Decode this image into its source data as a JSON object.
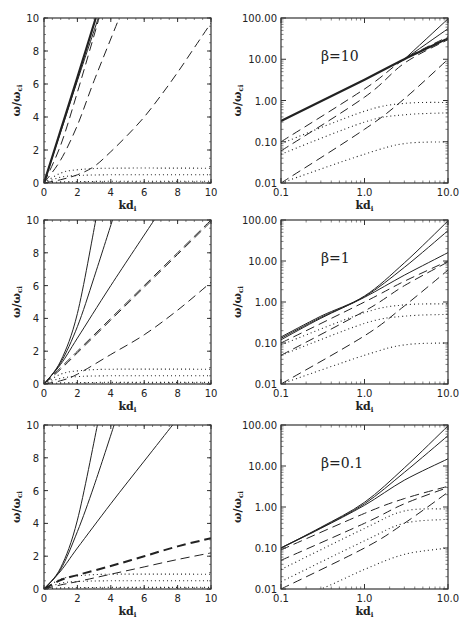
{
  "figure": {
    "xlabel": "kd",
    "xlabel_sub": "i",
    "ylabel": "ω/ω",
    "ylabel_sub": "ci"
  },
  "chart_data": [
    {
      "id": "linear-beta10",
      "type": "line",
      "row": 0,
      "col": 0,
      "scale": "linear",
      "title": "",
      "xlabel": "kd_i",
      "ylabel": "ω/ω_ci",
      "xlim": [
        0,
        10
      ],
      "ylim": [
        0,
        10
      ],
      "xticks": [
        "0",
        "2",
        "4",
        "6",
        "8",
        "10"
      ],
      "yticks": [
        "0",
        "2",
        "4",
        "6",
        "8",
        "10"
      ],
      "series": [
        {
          "name": "solid-1",
          "style": "solid",
          "width": 2.2,
          "x": [
            0,
            1,
            2,
            3.1
          ],
          "y": [
            0,
            3.2,
            6.4,
            10
          ]
        },
        {
          "name": "solid-2",
          "style": "solid",
          "width": 1,
          "x": [
            0,
            1,
            2,
            3.25
          ],
          "y": [
            0,
            3.1,
            6.2,
            10
          ]
        },
        {
          "name": "dash-1",
          "style": "dash",
          "x": [
            0,
            1,
            2,
            3.3
          ],
          "y": [
            0,
            2.3,
            5.5,
            10
          ]
        },
        {
          "name": "dash-2",
          "style": "dash",
          "x": [
            0,
            1,
            2,
            3,
            4.5
          ],
          "y": [
            0,
            1.4,
            3.5,
            6.2,
            10
          ]
        },
        {
          "name": "dash-3",
          "style": "dash",
          "x": [
            0,
            1,
            2,
            3,
            4,
            5,
            6,
            7,
            8,
            9,
            10
          ],
          "y": [
            0,
            0.2,
            0.5,
            1.0,
            1.9,
            2.9,
            4.0,
            5.3,
            6.7,
            8.2,
            9.7
          ]
        },
        {
          "name": "dot-1",
          "style": "dot",
          "x": [
            0,
            1,
            2,
            4,
            10
          ],
          "y": [
            0,
            0.6,
            0.8,
            0.9,
            0.9
          ]
        },
        {
          "name": "dot-2",
          "style": "dot",
          "x": [
            0,
            1,
            2,
            4,
            10
          ],
          "y": [
            0,
            0.35,
            0.45,
            0.5,
            0.5
          ]
        },
        {
          "name": "dot-3",
          "style": "dot",
          "x": [
            0,
            1,
            2,
            4,
            10
          ],
          "y": [
            0,
            0.06,
            0.08,
            0.1,
            0.1
          ]
        }
      ]
    },
    {
      "id": "log-beta10",
      "type": "line",
      "row": 0,
      "col": 1,
      "scale": "log",
      "title": "β=10",
      "xlabel": "kd_i",
      "ylabel": "ω/ω_ci",
      "xlim": [
        0.1,
        10.0
      ],
      "ylim": [
        0.01,
        100.0
      ],
      "xticks": [
        "0.1",
        "1.0",
        "10.0"
      ],
      "yticks": [
        "0.01",
        "0.10",
        "1.00",
        "10.00",
        "100.00"
      ],
      "series": [
        {
          "name": "solid-thick",
          "style": "solid",
          "width": 2.2,
          "x": [
            0.1,
            1,
            3,
            10
          ],
          "y": [
            0.32,
            3.2,
            10,
            32
          ]
        },
        {
          "name": "solid-2",
          "style": "solid",
          "width": 1,
          "x": [
            3,
            10
          ],
          "y": [
            10,
            95
          ]
        },
        {
          "name": "solid-3",
          "style": "solid",
          "width": 1,
          "x": [
            3,
            10
          ],
          "y": [
            10,
            55
          ]
        },
        {
          "name": "dash-1",
          "style": "dash",
          "x": [
            0.1,
            1,
            3,
            10
          ],
          "y": [
            0.1,
            1.9,
            10,
            35
          ]
        },
        {
          "name": "dash-2",
          "style": "dash",
          "x": [
            0.1,
            1,
            3,
            10
          ],
          "y": [
            0.06,
            1.2,
            8,
            30
          ]
        },
        {
          "name": "dash-3",
          "style": "dash",
          "x": [
            0.1,
            1,
            3,
            10
          ],
          "y": [
            0.01,
            0.2,
            1.1,
            10
          ]
        },
        {
          "name": "dot-1",
          "style": "dot",
          "x": [
            0.1,
            1,
            3,
            10
          ],
          "y": [
            0.09,
            0.55,
            0.85,
            0.9
          ]
        },
        {
          "name": "dot-2",
          "style": "dot",
          "x": [
            0.1,
            1,
            3,
            10
          ],
          "y": [
            0.05,
            0.3,
            0.45,
            0.5
          ]
        },
        {
          "name": "dot-3",
          "style": "dot",
          "x": [
            0.1,
            1,
            3,
            10
          ],
          "y": [
            0.01,
            0.05,
            0.09,
            0.1
          ]
        }
      ]
    },
    {
      "id": "linear-beta1",
      "type": "line",
      "row": 1,
      "col": 0,
      "scale": "linear",
      "title": "",
      "xlabel": "kd_i",
      "ylabel": "ω/ω_ci",
      "xlim": [
        0,
        10
      ],
      "ylim": [
        0,
        10
      ],
      "xticks": [
        "0",
        "2",
        "4",
        "6",
        "8",
        "10"
      ],
      "yticks": [
        "0",
        "2",
        "4",
        "6",
        "8",
        "10"
      ],
      "series": [
        {
          "name": "solid-1",
          "style": "solid",
          "width": 1,
          "x": [
            0,
            1,
            2,
            3.1
          ],
          "y": [
            0,
            1.4,
            4.3,
            10
          ]
        },
        {
          "name": "solid-2",
          "style": "solid",
          "width": 1,
          "x": [
            0,
            1,
            2,
            3,
            4.1
          ],
          "y": [
            0,
            1.3,
            3.5,
            6.5,
            10
          ]
        },
        {
          "name": "solid-3",
          "style": "solid",
          "width": 1,
          "x": [
            0,
            1,
            2,
            4,
            6.6
          ],
          "y": [
            0,
            1.2,
            2.8,
            6,
            10
          ]
        },
        {
          "name": "dash-1",
          "style": "dash",
          "x": [
            0,
            1,
            2,
            4,
            6,
            8,
            10
          ],
          "y": [
            0,
            1.0,
            2.0,
            4.0,
            6.0,
            8.0,
            10
          ]
        },
        {
          "name": "dash-2",
          "style": "dash",
          "x": [
            0,
            1,
            2,
            4,
            6,
            8,
            10
          ],
          "y": [
            0,
            0.9,
            1.9,
            3.9,
            5.9,
            7.9,
            9.9
          ]
        },
        {
          "name": "dash-3",
          "style": "dash",
          "x": [
            0,
            1,
            2,
            4,
            6,
            8,
            10
          ],
          "y": [
            0,
            0.2,
            0.6,
            1.8,
            3.0,
            4.5,
            6.2
          ]
        },
        {
          "name": "dot-1",
          "style": "dot",
          "x": [
            0,
            1,
            2,
            4,
            10
          ],
          "y": [
            0,
            0.6,
            0.8,
            0.9,
            0.9
          ]
        },
        {
          "name": "dot-2",
          "style": "dot",
          "x": [
            0,
            1,
            2,
            4,
            10
          ],
          "y": [
            0,
            0.35,
            0.45,
            0.5,
            0.5
          ]
        },
        {
          "name": "dot-3",
          "style": "dot",
          "x": [
            0,
            1,
            2,
            4,
            10
          ],
          "y": [
            0,
            0.06,
            0.08,
            0.1,
            0.1
          ]
        }
      ]
    },
    {
      "id": "log-beta1",
      "type": "line",
      "row": 1,
      "col": 1,
      "scale": "log",
      "title": "β=1",
      "xlabel": "kd_i",
      "ylabel": "ω/ω_ci",
      "xlim": [
        0.1,
        10.0
      ],
      "ylim": [
        0.01,
        100.0
      ],
      "xticks": [
        "0.1",
        "1.0",
        "10.0"
      ],
      "yticks": [
        "0.01",
        "0.10",
        "1.00",
        "10.00",
        "100.00"
      ],
      "series": [
        {
          "name": "solid-1",
          "style": "solid",
          "width": 1,
          "x": [
            0.1,
            0.3,
            1,
            3,
            10
          ],
          "y": [
            0.14,
            0.45,
            1.4,
            9,
            95
          ]
        },
        {
          "name": "solid-2",
          "style": "solid",
          "width": 1,
          "x": [
            0.1,
            0.3,
            1,
            3,
            10
          ],
          "y": [
            0.13,
            0.42,
            1.35,
            7,
            55
          ]
        },
        {
          "name": "solid-3",
          "style": "solid",
          "width": 1,
          "x": [
            0.1,
            0.3,
            1,
            3,
            10
          ],
          "y": [
            0.12,
            0.4,
            1.3,
            4.5,
            16
          ]
        },
        {
          "name": "dash-1",
          "style": "dash",
          "x": [
            0.1,
            1,
            3,
            10
          ],
          "y": [
            0.1,
            1.0,
            3.2,
            10
          ]
        },
        {
          "name": "dash-2",
          "style": "dash",
          "x": [
            0.1,
            1,
            3,
            10
          ],
          "y": [
            0.05,
            0.6,
            2.5,
            9.5
          ]
        },
        {
          "name": "dash-3",
          "style": "dash",
          "x": [
            0.1,
            1,
            3,
            10
          ],
          "y": [
            0.01,
            0.15,
            0.8,
            6
          ]
        },
        {
          "name": "dot-1",
          "style": "dot",
          "x": [
            0.1,
            1,
            3,
            10
          ],
          "y": [
            0.09,
            0.55,
            0.85,
            0.9
          ]
        },
        {
          "name": "dot-2",
          "style": "dot",
          "x": [
            0.1,
            1,
            3,
            10
          ],
          "y": [
            0.05,
            0.3,
            0.45,
            0.5
          ]
        },
        {
          "name": "dot-3",
          "style": "dot",
          "x": [
            0.1,
            1,
            3,
            10
          ],
          "y": [
            0.01,
            0.05,
            0.09,
            0.1
          ]
        }
      ]
    },
    {
      "id": "linear-beta0.1",
      "type": "line",
      "row": 2,
      "col": 0,
      "scale": "linear",
      "title": "",
      "xlabel": "kd_i",
      "ylabel": "ω/ω_ci",
      "xlim": [
        0,
        10
      ],
      "ylim": [
        0,
        10
      ],
      "xticks": [
        "0",
        "2",
        "4",
        "6",
        "8",
        "10"
      ],
      "yticks": [
        "0",
        "2",
        "4",
        "6",
        "8",
        "10"
      ],
      "series": [
        {
          "name": "solid-1",
          "style": "solid",
          "width": 1,
          "x": [
            0,
            1,
            2,
            3.2
          ],
          "y": [
            0,
            1.3,
            4.2,
            10
          ]
        },
        {
          "name": "solid-2",
          "style": "solid",
          "width": 1,
          "x": [
            0,
            1,
            2,
            3,
            4.2
          ],
          "y": [
            0,
            1.2,
            3.5,
            6.3,
            10
          ]
        },
        {
          "name": "solid-3",
          "style": "solid",
          "width": 1,
          "x": [
            0,
            1,
            2,
            4,
            6,
            7.7
          ],
          "y": [
            0,
            1.1,
            2.5,
            5.2,
            7.8,
            10
          ]
        },
        {
          "name": "dash-thick",
          "style": "dash",
          "width": 2,
          "x": [
            0,
            1,
            2,
            4,
            6,
            8,
            10
          ],
          "y": [
            0,
            0.55,
            0.85,
            1.4,
            2.0,
            2.6,
            3.1
          ]
        },
        {
          "name": "dash-2",
          "style": "dash",
          "x": [
            0,
            1,
            2,
            4,
            6,
            8,
            10
          ],
          "y": [
            0,
            0.25,
            0.45,
            0.9,
            1.35,
            1.8,
            2.2
          ]
        },
        {
          "name": "dot-1",
          "style": "dot",
          "x": [
            0,
            1,
            2,
            4,
            10
          ],
          "y": [
            0,
            0.6,
            0.8,
            0.9,
            0.9
          ]
        },
        {
          "name": "dot-2",
          "style": "dot",
          "x": [
            0,
            1,
            2,
            4,
            10
          ],
          "y": [
            0,
            0.35,
            0.45,
            0.5,
            0.5
          ]
        },
        {
          "name": "dot-3",
          "style": "dot",
          "x": [
            0,
            1,
            2,
            4,
            10
          ],
          "y": [
            0,
            0.06,
            0.08,
            0.1,
            0.1
          ]
        }
      ]
    },
    {
      "id": "log-beta0.1",
      "type": "line",
      "row": 2,
      "col": 1,
      "scale": "log",
      "title": "β=0.1",
      "xlabel": "kd_i",
      "ylabel": "ω/ω_ci",
      "xlim": [
        0.1,
        10.0
      ],
      "ylim": [
        0.01,
        100.0
      ],
      "xticks": [
        "0.1",
        "1.0",
        "10.0"
      ],
      "yticks": [
        "0.01",
        "0.10",
        "1.00",
        "10.00",
        "100.00"
      ],
      "series": [
        {
          "name": "solid-1",
          "style": "solid",
          "width": 1,
          "x": [
            0.1,
            0.3,
            1,
            3,
            10
          ],
          "y": [
            0.1,
            0.32,
            1.3,
            9,
            95
          ]
        },
        {
          "name": "solid-2",
          "style": "solid",
          "width": 1,
          "x": [
            0.1,
            0.3,
            1,
            3,
            10
          ],
          "y": [
            0.1,
            0.31,
            1.2,
            7,
            55
          ]
        },
        {
          "name": "solid-3",
          "style": "solid",
          "width": 1,
          "x": [
            0.1,
            0.3,
            1,
            3,
            10
          ],
          "y": [
            0.1,
            0.3,
            1.1,
            4.5,
            15
          ]
        },
        {
          "name": "dash-1",
          "style": "dash",
          "x": [
            0.1,
            1,
            3,
            10
          ],
          "y": [
            0.09,
            0.7,
            1.6,
            3.2
          ]
        },
        {
          "name": "dash-2",
          "style": "dash",
          "x": [
            0.1,
            1,
            3,
            10
          ],
          "y": [
            0.05,
            0.4,
            1.2,
            3.0
          ]
        },
        {
          "name": "dash-3",
          "style": "dash",
          "x": [
            0.1,
            1,
            3,
            10
          ],
          "y": [
            0.01,
            0.1,
            0.4,
            2.3
          ]
        },
        {
          "name": "dot-1",
          "style": "dot",
          "x": [
            0.1,
            1,
            3,
            10
          ],
          "y": [
            0.03,
            0.3,
            0.8,
            0.9
          ]
        },
        {
          "name": "dot-2",
          "style": "dot",
          "x": [
            0.1,
            1,
            3,
            10
          ],
          "y": [
            0.015,
            0.15,
            0.4,
            0.5
          ]
        },
        {
          "name": "dot-3",
          "style": "dot",
          "x": [
            0.1,
            0.3,
            1,
            3,
            10
          ],
          "y": [
            0.005,
            0.01,
            0.03,
            0.07,
            0.1
          ]
        }
      ]
    }
  ]
}
